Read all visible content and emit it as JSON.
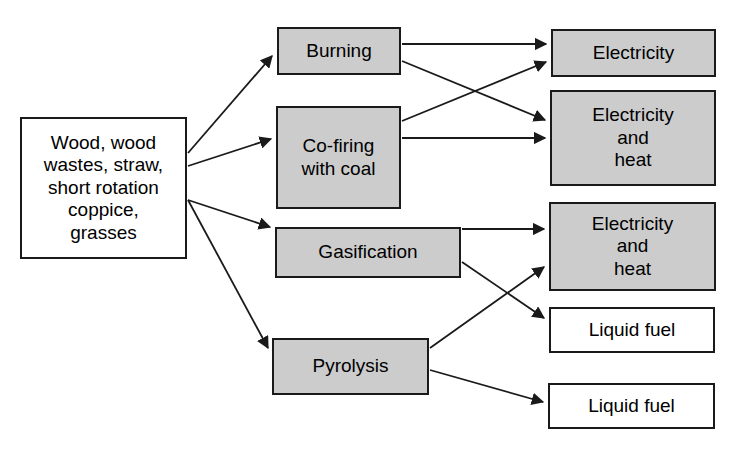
{
  "diagram": {
    "canvas": {
      "width": 740,
      "height": 450,
      "background": "#ffffff"
    },
    "colors": {
      "process_fill": "#cccccc",
      "product_fill": "#ffffff",
      "stroke": "#1a1a1a",
      "text": "#000000"
    },
    "nodes": [
      {
        "id": "feedstock",
        "label": "Wood, wood\nwastes, straw,\nshort rotation\ncoppice,\ngrasses",
        "fill": "#ffffff",
        "x": 20,
        "y": 117,
        "w": 167,
        "h": 142,
        "font_size": 19
      },
      {
        "id": "burning",
        "label": "Burning",
        "fill": "#cccccc",
        "x": 277,
        "y": 27,
        "w": 124,
        "h": 48,
        "font_size": 19
      },
      {
        "id": "cofiring",
        "label": "Co-firing\nwith coal",
        "fill": "#cccccc",
        "x": 276,
        "y": 106,
        "w": 125,
        "h": 103,
        "font_size": 19
      },
      {
        "id": "gasification",
        "label": "Gasification",
        "fill": "#cccccc",
        "x": 275,
        "y": 227,
        "w": 186,
        "h": 51,
        "font_size": 19
      },
      {
        "id": "pyrolysis",
        "label": "Pyrolysis",
        "fill": "#cccccc",
        "x": 272,
        "y": 338,
        "w": 157,
        "h": 57,
        "font_size": 19
      },
      {
        "id": "electricity",
        "label": "Electricity",
        "fill": "#cccccc",
        "x": 551,
        "y": 29,
        "w": 165,
        "h": 48,
        "font_size": 19
      },
      {
        "id": "elec-heat-1",
        "label": "Electricity\nand\nheat",
        "fill": "#cccccc",
        "x": 550,
        "y": 90,
        "w": 166,
        "h": 96,
        "font_size": 19
      },
      {
        "id": "elec-heat-2",
        "label": "Electricity\nand\nheat",
        "fill": "#cccccc",
        "x": 549,
        "y": 202,
        "w": 167,
        "h": 89,
        "font_size": 19
      },
      {
        "id": "liquid-fuel-1",
        "label": "Liquid fuel",
        "fill": "#ffffff",
        "x": 549,
        "y": 307,
        "w": 166,
        "h": 46,
        "font_size": 19
      },
      {
        "id": "liquid-fuel-2",
        "label": "Liquid fuel",
        "fill": "#ffffff",
        "x": 548,
        "y": 383,
        "w": 167,
        "h": 46,
        "font_size": 19
      }
    ],
    "edges": [
      {
        "id": "feedstock-to-burning",
        "from": "feedstock",
        "to": "burning",
        "x1": 188,
        "y1": 153,
        "x2": 272,
        "y2": 56
      },
      {
        "id": "feedstock-to-cofiring",
        "from": "feedstock",
        "to": "cofiring",
        "x1": 188,
        "y1": 166,
        "x2": 271,
        "y2": 139
      },
      {
        "id": "feedstock-to-gasification",
        "from": "feedstock",
        "to": "gasification",
        "x1": 188,
        "y1": 200,
        "x2": 270,
        "y2": 227
      },
      {
        "id": "feedstock-to-pyrolysis",
        "from": "feedstock",
        "to": "pyrolysis",
        "x1": 188,
        "y1": 200,
        "x2": 268,
        "y2": 348
      },
      {
        "id": "burning-to-electricity",
        "from": "burning",
        "to": "electricity",
        "x1": 402,
        "y1": 44,
        "x2": 546,
        "y2": 44
      },
      {
        "id": "burning-to-elec-heat-1",
        "from": "burning",
        "to": "elec-heat-1",
        "x1": 402,
        "y1": 61,
        "x2": 545,
        "y2": 120
      },
      {
        "id": "cofiring-to-electricity",
        "from": "cofiring",
        "to": "electricity",
        "x1": 402,
        "y1": 121,
        "x2": 546,
        "y2": 62
      },
      {
        "id": "cofiring-to-elec-heat-1",
        "from": "cofiring",
        "to": "elec-heat-1",
        "x1": 402,
        "y1": 138,
        "x2": 545,
        "y2": 138
      },
      {
        "id": "gasification-to-elec-heat-2",
        "from": "gasification",
        "to": "elec-heat-2",
        "x1": 462,
        "y1": 229,
        "x2": 544,
        "y2": 229
      },
      {
        "id": "gasification-to-liquid-fuel-1",
        "from": "gasification",
        "to": "liquid-fuel-1",
        "x1": 462,
        "y1": 262,
        "x2": 544,
        "y2": 318
      },
      {
        "id": "pyrolysis-to-elec-heat-2",
        "from": "pyrolysis",
        "to": "elec-heat-2",
        "x1": 430,
        "y1": 348,
        "x2": 544,
        "y2": 267
      },
      {
        "id": "pyrolysis-to-liquid-fuel-2",
        "from": "pyrolysis",
        "to": "liquid-fuel-2",
        "x1": 430,
        "y1": 370,
        "x2": 543,
        "y2": 402
      }
    ]
  }
}
